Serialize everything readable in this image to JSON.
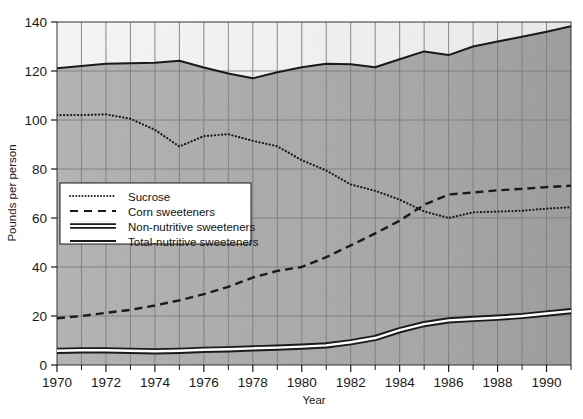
{
  "chart_data": {
    "type": "line",
    "title": "",
    "xlabel": "Year",
    "ylabel": "Pounds per person",
    "xlim": [
      1970,
      1991
    ],
    "ylim": [
      0,
      140
    ],
    "ytick_values": [
      0,
      20,
      40,
      60,
      80,
      100,
      120,
      140
    ],
    "ytick_labels": [
      "0",
      "20",
      "40",
      "60",
      "80",
      "100",
      "120",
      "140"
    ],
    "xtick_values": [
      1970,
      1972,
      1974,
      1976,
      1978,
      1980,
      1982,
      1984,
      1986,
      1988,
      1990
    ],
    "xtick_labels": [
      "1970",
      "1972",
      "1974",
      "1976",
      "1978",
      "1980",
      "1982",
      "1984",
      "1986",
      "1988",
      "1990"
    ],
    "x_minor_tick_step": 1,
    "grid": "both",
    "legend_position": "center-left",
    "x": [
      1970,
      1971,
      1972,
      1973,
      1974,
      1975,
      1976,
      1977,
      1978,
      1979,
      1980,
      1981,
      1982,
      1983,
      1984,
      1985,
      1986,
      1987,
      1988,
      1989,
      1990,
      1991
    ],
    "series": [
      {
        "name": "Sucrose",
        "style": "dotted",
        "values": [
          102.0,
          102.0,
          102.3,
          100.5,
          96.0,
          89.2,
          93.4,
          94.2,
          91.5,
          89.3,
          83.6,
          79.4,
          73.7,
          71.1,
          67.5,
          62.7,
          60.0,
          62.3,
          62.6,
          63.0,
          63.8,
          64.4
        ]
      },
      {
        "name": "Corn sweeteners",
        "style": "dashed",
        "values": [
          19.1,
          20.0,
          21.3,
          22.5,
          24.3,
          26.4,
          28.9,
          31.9,
          35.7,
          38.4,
          40.0,
          44.0,
          48.8,
          53.7,
          58.9,
          65.4,
          69.6,
          70.4,
          71.3,
          71.9,
          72.6,
          73.2
        ]
      },
      {
        "name": "Non-nutritive sweeteners",
        "style": "double-solid",
        "values": [
          5.8,
          6.0,
          6.0,
          5.8,
          5.6,
          5.8,
          6.2,
          6.4,
          6.8,
          7.1,
          7.5,
          8.0,
          9.3,
          11.0,
          14.2,
          16.7,
          18.2,
          18.8,
          19.3,
          20.0,
          21.0,
          22.0
        ]
      },
      {
        "name": "Total-nutritive sweeteners",
        "style": "solid",
        "values": [
          121.1,
          122.0,
          123.0,
          123.2,
          123.4,
          124.2,
          121.4,
          119.0,
          117.0,
          119.5,
          121.5,
          123.0,
          122.8,
          121.5,
          124.8,
          128.0,
          126.5,
          130.0,
          132.0,
          134.0,
          136.0,
          138.3
        ]
      }
    ]
  },
  "colors": {
    "line": "#1a1a1a",
    "grid": "#7d7d7d",
    "plot_upper_bg": "#f4f4f4",
    "plot_lower_bg": "#a8a8a8",
    "legend_bg": "#ffffff",
    "legend_border": "#1a1a1a",
    "text": "#1a1a1a"
  },
  "legend": {
    "items": [
      {
        "label": "Sucrose",
        "marker": "dotted-line-marker"
      },
      {
        "label": "Corn sweeteners",
        "marker": "dashed-line-marker"
      },
      {
        "label": "Non-nutritive sweeteners",
        "marker": "double-line-marker"
      },
      {
        "label": "Total-nutritive sweeteners",
        "marker": "solid-line-marker"
      }
    ]
  }
}
